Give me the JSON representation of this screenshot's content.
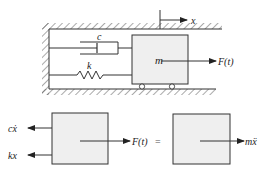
{
  "diagram": {
    "colors": {
      "line": "#333333",
      "mass_fill": "#efefef",
      "hatch": "#555555",
      "background": "#ffffff"
    },
    "system": {
      "displacement_label": "x",
      "damper_label": "c",
      "spring_label": "k",
      "mass_label": "m",
      "force_label": "F(t)"
    },
    "free_body": {
      "damping_force_label": "cẋ",
      "spring_force_label": "kx",
      "applied_force_label": "F(t)",
      "equals_sign": "=",
      "inertia_label": "mẍ"
    }
  }
}
